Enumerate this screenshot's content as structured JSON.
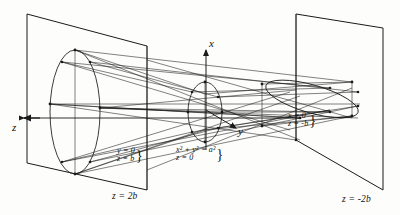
{
  "figure": {
    "background_color": "#fdfdfc",
    "ink_color": "#1a1a1a",
    "axes": [
      {
        "name": "z-axis",
        "label": "z",
        "direction": "left",
        "x": 14,
        "y": 118
      },
      {
        "name": "x-axis",
        "label": "x",
        "direction": "up",
        "x": 209,
        "y": 42
      },
      {
        "name": "y-axis",
        "label": "y",
        "direction": "down-right",
        "x": 238,
        "y": 131
      }
    ],
    "planes": [
      {
        "name": "left-plane",
        "label": "z = 2b",
        "x": 112,
        "y": 192
      },
      {
        "name": "right-plane",
        "label": "z = -2b",
        "x": 342,
        "y": 195
      }
    ],
    "annotations": [
      {
        "name": "line-y0-zb",
        "lines": [
          "y = 0",
          "z = b"
        ],
        "brace": "}",
        "x": 117,
        "y": 147
      },
      {
        "name": "circle-x2y2a2-z0",
        "lines": [
          "x² + y² = a²",
          "z = 0"
        ],
        "brace": "}",
        "x": 176,
        "y": 146
      },
      {
        "name": "line-x0-znegb",
        "lines": [
          "x = 0",
          "z = -b"
        ],
        "brace": "}",
        "x": 288,
        "y": 112
      }
    ],
    "curves": [
      {
        "name": "left-ellipse",
        "desc": "large vertical ellipse at z = b"
      },
      {
        "name": "center-circle",
        "desc": "circle x²+y²=a² in plane z = 0"
      },
      {
        "name": "right-ellipse",
        "desc": "flattened tilted ellipse at z = -b"
      }
    ]
  }
}
